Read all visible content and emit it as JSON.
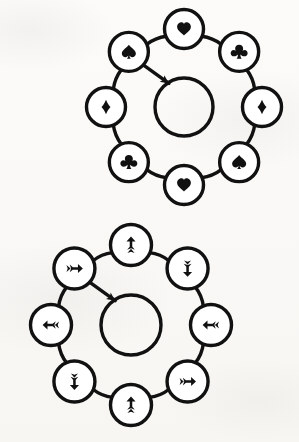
{
  "figures": [
    {
      "id": "suit-cycle-diagram",
      "name": "card-suit-ring-diagram",
      "description": "Ring of eight circular nodes containing playing-card suit symbols arranged around an empty central circle, with a clockwise direction arrow.",
      "direction": "clockwise",
      "center": {
        "label": "",
        "shape": "circle"
      },
      "nodes": [
        {
          "position": "top",
          "angle_deg": 270,
          "symbol": "♥",
          "icon": "heart-suit-icon",
          "name": "heart"
        },
        {
          "position": "top-right",
          "angle_deg": 315,
          "symbol": "♣",
          "icon": "club-suit-icon",
          "name": "club"
        },
        {
          "position": "right",
          "angle_deg": 0,
          "symbol": "♦",
          "icon": "diamond-suit-icon",
          "name": "diamond"
        },
        {
          "position": "bottom-right",
          "angle_deg": 45,
          "symbol": "♠",
          "icon": "spade-suit-icon",
          "name": "spade"
        },
        {
          "position": "bottom",
          "angle_deg": 90,
          "symbol": "♥",
          "icon": "heart-suit-icon",
          "name": "heart"
        },
        {
          "position": "bottom-left",
          "angle_deg": 135,
          "symbol": "♣",
          "icon": "club-suit-icon",
          "name": "club"
        },
        {
          "position": "left",
          "angle_deg": 180,
          "symbol": "♦",
          "icon": "diamond-suit-icon",
          "name": "diamond"
        },
        {
          "position": "top-left",
          "angle_deg": 225,
          "symbol": "♠",
          "icon": "spade-suit-icon",
          "name": "spade"
        }
      ]
    },
    {
      "id": "arrow-cycle-diagram",
      "name": "direction-arrow-ring-diagram",
      "description": "Ring of eight circular nodes containing double-headed directional arrows arranged around an empty central circle, with a clockwise direction arrow.",
      "direction": "clockwise",
      "center": {
        "label": "",
        "shape": "circle"
      },
      "nodes": [
        {
          "position": "top",
          "angle_deg": 270,
          "symbol": "↑",
          "icon": "arrow-up-icon",
          "name": "up"
        },
        {
          "position": "top-right",
          "angle_deg": 315,
          "symbol": "↓",
          "icon": "arrow-down-icon",
          "name": "down"
        },
        {
          "position": "right",
          "angle_deg": 0,
          "symbol": "←",
          "icon": "arrow-left-icon",
          "name": "left"
        },
        {
          "position": "bottom-right",
          "angle_deg": 45,
          "symbol": "→",
          "icon": "arrow-right-icon",
          "name": "right"
        },
        {
          "position": "bottom",
          "angle_deg": 90,
          "symbol": "↑",
          "icon": "arrow-up-icon",
          "name": "up"
        },
        {
          "position": "bottom-left",
          "angle_deg": 135,
          "symbol": "↓",
          "icon": "arrow-down-icon",
          "name": "down"
        },
        {
          "position": "left",
          "angle_deg": 180,
          "symbol": "←",
          "icon": "arrow-left-icon",
          "name": "left"
        },
        {
          "position": "top-left",
          "angle_deg": 225,
          "symbol": "→",
          "icon": "arrow-right-icon",
          "name": "right"
        }
      ]
    }
  ],
  "style": {
    "ink": "#111111",
    "paper": "#fbfaf8",
    "node_fill": "#ffffff"
  }
}
